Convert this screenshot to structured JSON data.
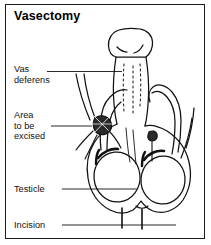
{
  "figure": {
    "title": "Vasectomy",
    "border_color": "#1a1a1a",
    "background_color": "#ffffff",
    "ink_color": "#111111",
    "width": 211,
    "height": 245
  },
  "labels": {
    "vas_deferens": "Vas\ndeferens",
    "area_to_be_excised": "Area\nto be\nexcised",
    "testicle": "Testicle",
    "incision": "Incision"
  },
  "illustration": {
    "description": "line-art anatomical drawing of male reproductive organs showing penis, scrotum, two testicles, the vas deferens tubes looping upward, a darkened ligated segment marking the area to be excised, and two short vertical incision marks on the lower scrotum",
    "parts": [
      "penis-shaft",
      "glans",
      "scrotum",
      "left-testicle",
      "right-testicle",
      "left-vas-deferens",
      "right-vas-deferens",
      "excised-segment",
      "incision-marks"
    ]
  }
}
